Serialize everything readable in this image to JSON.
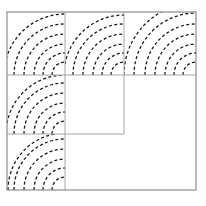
{
  "figure": {
    "canvas": {
      "width": 206,
      "height": 206,
      "background": "#ffffff"
    },
    "colors": {
      "border": "#8c8c8c",
      "gridline": "#a6a6a6",
      "arc": "#1a1a1a"
    },
    "stroke_widths": {
      "border": 1.2,
      "gridline": 1.0,
      "arc": 1.3
    },
    "dash_pattern": "3,2.4",
    "outer_rect": {
      "x": 7,
      "y": 12,
      "width": 189,
      "height": 178
    },
    "gridlines": [
      {
        "name": "vertical-line-1",
        "orientation": "vertical",
        "x": 65,
        "y1": 12,
        "y2": 190
      },
      {
        "name": "vertical-line-2",
        "orientation": "vertical",
        "x": 124,
        "y1": 12,
        "y2": 134
      },
      {
        "name": "horizontal-line-1",
        "orientation": "horizontal",
        "y": 75,
        "x1": 7,
        "x2": 196
      },
      {
        "name": "horizontal-line-2",
        "orientation": "horizontal",
        "y": 134,
        "x1": 7,
        "x2": 124
      }
    ],
    "arc_groups": [
      {
        "name": "arc-group-top-left",
        "center": {
          "x": 65,
          "y": 75
        },
        "quadrant": "upper-left",
        "radii": [
          13,
          22,
          31,
          41,
          51,
          61
        ],
        "cell": {
          "x": 7,
          "y": 12,
          "width": 58,
          "height": 63
        }
      },
      {
        "name": "arc-group-top-middle",
        "center": {
          "x": 124,
          "y": 75
        },
        "quadrant": "upper-left",
        "radii": [
          13,
          22,
          31,
          41,
          51,
          60
        ],
        "cell": {
          "x": 65,
          "y": 12,
          "width": 59,
          "height": 63
        }
      },
      {
        "name": "arc-group-top-right",
        "center": {
          "x": 196,
          "y": 75
        },
        "quadrant": "upper-left",
        "radii": [
          13,
          22,
          31,
          41,
          51,
          62,
          72
        ],
        "cell": {
          "x": 124,
          "y": 12,
          "width": 72,
          "height": 63
        }
      },
      {
        "name": "arc-group-bottom-left",
        "center": {
          "x": 65,
          "y": 134
        },
        "quadrant": "upper-left",
        "radii": [
          13,
          22,
          31,
          41,
          51,
          59
        ],
        "cell": {
          "x": 7,
          "y": 75,
          "width": 58,
          "height": 59
        }
      },
      {
        "name": "arc-group-lower-left",
        "center": {
          "x": 65,
          "y": 190
        },
        "quadrant": "upper-left",
        "radii": [
          13,
          22,
          31,
          41,
          51,
          57
        ],
        "cell": {
          "x": 7,
          "y": 134,
          "width": 58,
          "height": 56
        }
      }
    ]
  }
}
